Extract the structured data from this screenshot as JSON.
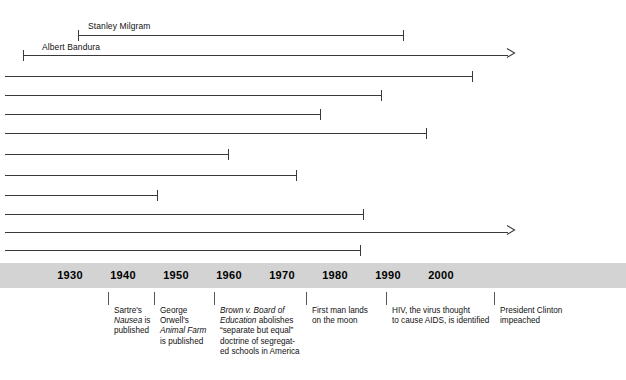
{
  "chart_data": {
    "type": "timeline",
    "title": "",
    "xlabel": "",
    "axis": {
      "ticks": [
        1930,
        1940,
        1950,
        1960,
        1970,
        1980,
        1990,
        2000
      ],
      "tick_labels": [
        "1930",
        "1940",
        "1950",
        "1960",
        "1970",
        "1980",
        "1990",
        "2000"
      ],
      "xlim": [
        1922,
        2008
      ],
      "band_color": "#d3d3d3",
      "grid": false
    },
    "bars": [
      {
        "label": "Stanley Milgram",
        "start_x": 78,
        "end_x": 403,
        "y": 35,
        "start_cap": "tick",
        "end_cap": "tick",
        "label_x": 88,
        "label_y": 22
      },
      {
        "label": "Albert Bandura",
        "start_x": 23,
        "end_x": 515,
        "y": 55,
        "start_cap": "tick",
        "end_cap": "arrow",
        "label_x": 42,
        "label_y": 43
      },
      {
        "label": "",
        "start_x": 5,
        "end_x": 472,
        "y": 76,
        "start_cap": "none",
        "end_cap": "tick",
        "label_x": 0,
        "label_y": 0
      },
      {
        "label": "",
        "start_x": 5,
        "end_x": 381,
        "y": 95,
        "start_cap": "none",
        "end_cap": "tick",
        "label_x": 0,
        "label_y": 0
      },
      {
        "label": "",
        "start_x": 5,
        "end_x": 320,
        "y": 114,
        "start_cap": "none",
        "end_cap": "tick",
        "label_x": 0,
        "label_y": 0
      },
      {
        "label": "",
        "start_x": 5,
        "end_x": 426,
        "y": 133,
        "start_cap": "none",
        "end_cap": "tick",
        "label_x": 0,
        "label_y": 0
      },
      {
        "label": "",
        "start_x": 5,
        "end_x": 228,
        "y": 154,
        "start_cap": "none",
        "end_cap": "tick",
        "label_x": 0,
        "label_y": 0
      },
      {
        "label": "",
        "start_x": 5,
        "end_x": 296,
        "y": 175,
        "start_cap": "none",
        "end_cap": "tick",
        "label_x": 0,
        "label_y": 0
      },
      {
        "label": "",
        "start_x": 5,
        "end_x": 157,
        "y": 195,
        "start_cap": "none",
        "end_cap": "tick",
        "label_x": 0,
        "label_y": 0
      },
      {
        "label": "",
        "start_x": 5,
        "end_x": 363,
        "y": 214,
        "start_cap": "none",
        "end_cap": "tick",
        "label_x": 0,
        "label_y": 0
      },
      {
        "label": "",
        "start_x": 5,
        "end_x": 515,
        "y": 232,
        "start_cap": "none",
        "end_cap": "arrow",
        "label_x": 0,
        "label_y": 0
      },
      {
        "label": "",
        "start_x": 5,
        "end_x": 360,
        "y": 250,
        "start_cap": "none",
        "end_cap": "tick",
        "label_x": 0,
        "label_y": 0
      }
    ],
    "events": [
      {
        "id": "sartre-nausea",
        "tick_x": 108,
        "width": 46,
        "lines": [
          [
            {
              "t": "Sartre's",
              "i": false
            }
          ],
          [
            {
              "t": "Nausea",
              "i": true
            },
            {
              "t": " is",
              "i": false
            }
          ],
          [
            {
              "t": "published",
              "i": false
            }
          ]
        ],
        "plain": "Sartre's Nausea is published"
      },
      {
        "id": "orwell-animal-farm",
        "tick_x": 154,
        "width": 56,
        "lines": [
          [
            {
              "t": "George",
              "i": false
            }
          ],
          [
            {
              "t": "Orwell's",
              "i": false
            }
          ],
          [
            {
              "t": "Animal Farm",
              "i": true
            }
          ],
          [
            {
              "t": "is published",
              "i": false
            }
          ]
        ],
        "plain": "George Orwell's Animal Farm is published"
      },
      {
        "id": "brown-v-board",
        "tick_x": 214,
        "width": 90,
        "lines": [
          [
            {
              "t": "Brown v. Board of",
              "i": true
            }
          ],
          [
            {
              "t": "Education",
              "i": true
            },
            {
              "t": " abolishes",
              "i": false
            }
          ],
          [
            {
              "t": "“separate but equal”",
              "i": false
            }
          ],
          [
            {
              "t": "doctrine of segregat-",
              "i": false
            }
          ],
          [
            {
              "t": "ed schools in America",
              "i": false
            }
          ]
        ],
        "plain": "Brown v. Board of Education abolishes “separate but equal” doctrine of segregated schools in America"
      },
      {
        "id": "moon-landing",
        "tick_x": 306,
        "width": 70,
        "lines": [
          [
            {
              "t": "First man lands",
              "i": false
            }
          ],
          [
            {
              "t": "on the moon",
              "i": false
            }
          ]
        ],
        "plain": "First man lands on the moon"
      },
      {
        "id": "hiv-identified",
        "tick_x": 386,
        "width": 100,
        "lines": [
          [
            {
              "t": "HIV, the virus thought",
              "i": false
            }
          ],
          [
            {
              "t": "to cause AIDS, is identified",
              "i": false
            }
          ]
        ],
        "plain": "HIV, the virus thought to cause AIDS, is identified"
      },
      {
        "id": "clinton-impeached",
        "tick_x": 494,
        "width": 90,
        "lines": [
          [
            {
              "t": "President Clinton",
              "i": false
            }
          ],
          [
            {
              "t": "impeached",
              "i": false
            }
          ]
        ],
        "plain": "President Clinton impeached"
      }
    ]
  },
  "layout": {
    "axis_band_top": 263,
    "axis_band_height": 25,
    "axis_tick_positions": [
      70,
      123,
      176,
      229,
      282,
      335,
      388,
      441
    ]
  }
}
